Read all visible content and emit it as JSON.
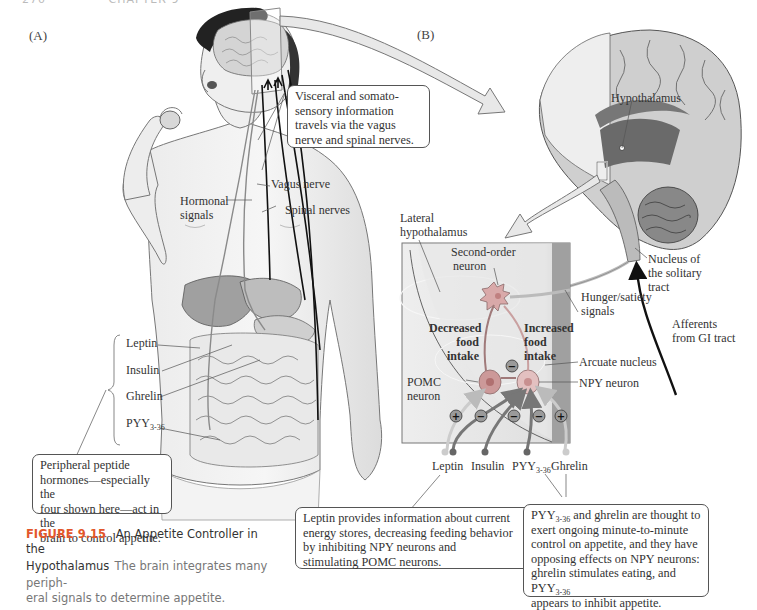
{
  "page_header": {
    "page_number": "270",
    "chapter": "CHAPTER 9"
  },
  "panels": {
    "a_label": "(A)",
    "b_label": "(B)"
  },
  "panel_a": {
    "callout_top": "Visceral and somato-sensory information travels via the vagus nerve and spinal nerves.",
    "callout_top_lines": [
      "Visceral and somato-",
      "sensory information",
      "travels via the vagus",
      "nerve and spinal nerves."
    ],
    "labels": {
      "vagus_nerve": "Vagus nerve",
      "spinal_nerves": "Spinal nerves",
      "hormonal_signals_1": "Hormonal",
      "hormonal_signals_2": "signals"
    },
    "hormones": [
      {
        "name": "Leptin"
      },
      {
        "name": "Insulin"
      },
      {
        "name": "Ghrelin"
      },
      {
        "name": "PYY",
        "subscript": "3-36"
      }
    ],
    "callout_bottom_lines": [
      "Peripheral peptide",
      "hormones—especially the",
      "four shown here—act in the",
      "brain to control appetite."
    ]
  },
  "panel_b": {
    "brain_labels": {
      "hypothalamus": "Hypothalamus",
      "nts_1": "Nucleus of",
      "nts_2": "the solitary",
      "nts_3": "tract",
      "afferents_1": "Afferents",
      "afferents_2": "from GI tract",
      "hunger_1": "Hunger/satiety",
      "hunger_2": "signals"
    },
    "inset_labels": {
      "lateral_1": "Lateral",
      "lateral_2": "hypothalamus",
      "second_order_1": "Second-order",
      "second_order_2": "neuron",
      "decreased_1": "Decreased",
      "decreased_2": "food",
      "decreased_3": "intake",
      "increased_1": "Increased",
      "increased_2": "food",
      "increased_3": "intake",
      "arcuate": "Arcuate nucleus",
      "npy": "NPY neuron",
      "pomc_1": "POMC",
      "pomc_2": "neuron"
    },
    "signs": {
      "plus": "+",
      "minus": "−"
    },
    "inputs": [
      {
        "name": "Leptin"
      },
      {
        "name": "Insulin"
      },
      {
        "name": "PYY",
        "subscript": "3-36"
      },
      {
        "name": "Ghrelin"
      }
    ],
    "callout_leptin_lines": [
      "Leptin provides information about current",
      "energy stores, decreasing feeding behavior",
      "by inhibiting NPY neurons and",
      "stimulating POMC neurons."
    ],
    "callout_pyy": {
      "line1_pre": "PYY",
      "line1_sub": "3-36",
      "line1_post": " and ghrelin are thought to",
      "line2": "exert ongoing minute-to-minute",
      "line3": "control on appetite, and they have",
      "line4": "opposing effects on NPY neurons:",
      "line5_pre": "ghrelin stimulates eating, and PYY",
      "line5_sub": "3-36",
      "line6": "appears to inhibit appetite."
    }
  },
  "caption": {
    "figure_number": "FIGURE 9.15",
    "title": "An Appetite Controller in the Hypothalamus",
    "title_line1": "An Appetite Controller in the",
    "title_line2": "Hypothalamus",
    "body_line1": "The brain integrates many periph-",
    "body_line2": "eral signals to determine appetite."
  },
  "colors": {
    "figure_label": "#e2572b",
    "brain_dark": "#6a6a6a",
    "brain_light": "#d9d9d9",
    "inset_bg": "#e3e3e3",
    "inset_edge": "#8e8e8e",
    "neuron_pink": "#c99",
    "sign_circle": "#9a9a9a"
  }
}
